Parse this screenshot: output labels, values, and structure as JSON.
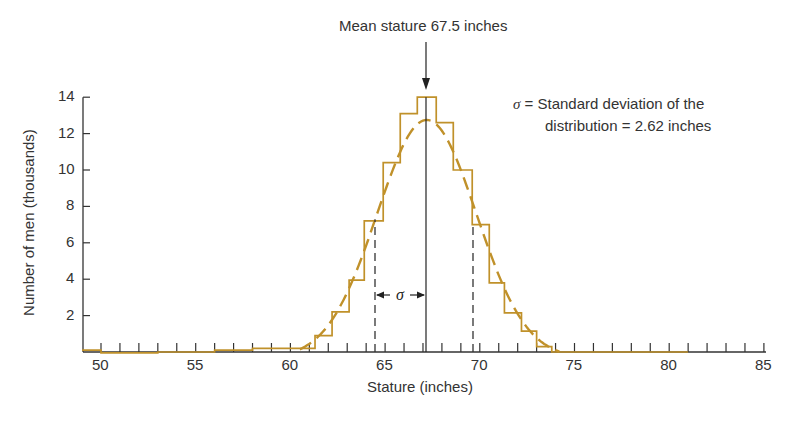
{
  "chart_data": {
    "type": "bar",
    "subtype": "histogram with fitted normal curve",
    "title": "Mean stature 67.5 inches",
    "xlabel": "Stature (inches)",
    "ylabel": "Number of men (thousands)",
    "xlim": [
      49,
      85
    ],
    "ylim": [
      0,
      14
    ],
    "x_ticks": [
      50,
      55,
      60,
      65,
      70,
      75,
      80,
      85
    ],
    "y_ticks": [
      2,
      4,
      6,
      8,
      10,
      12,
      14
    ],
    "grid": false,
    "annotation": {
      "symbol": "σ",
      "line1": "= Standard deviation of the",
      "line2": "distribution = 2.62 inches",
      "sigma_marker": "σ"
    },
    "mean": 67.5,
    "std_dev": 2.62,
    "histogram_bins": [
      {
        "x0": 49,
        "x1": 50,
        "value": 0.1
      },
      {
        "x0": 50,
        "x1": 53,
        "value": -0.05
      },
      {
        "x0": 53,
        "x1": 56,
        "value": 0.0
      },
      {
        "x0": 56,
        "x1": 58,
        "value": 0.1
      },
      {
        "x0": 58,
        "x1": 61.3,
        "value": 0.2
      },
      {
        "x0": 61.3,
        "x1": 62.2,
        "value": 0.9
      },
      {
        "x0": 62.2,
        "x1": 63.1,
        "value": 2.2
      },
      {
        "x0": 63.1,
        "x1": 63.9,
        "value": 3.95
      },
      {
        "x0": 63.9,
        "x1": 64.9,
        "value": 7.2
      },
      {
        "x0": 64.9,
        "x1": 65.8,
        "value": 10.4
      },
      {
        "x0": 65.8,
        "x1": 66.7,
        "value": 13.1
      },
      {
        "x0": 66.7,
        "x1": 67.7,
        "value": 14.0
      },
      {
        "x0": 67.7,
        "x1": 68.6,
        "value": 12.6
      },
      {
        "x0": 68.6,
        "x1": 69.6,
        "value": 10.0
      },
      {
        "x0": 69.6,
        "x1": 70.5,
        "value": 7.0
      },
      {
        "x0": 70.5,
        "x1": 71.3,
        "value": 3.8
      },
      {
        "x0": 71.3,
        "x1": 72.2,
        "value": 2.15
      },
      {
        "x0": 72.2,
        "x1": 73.0,
        "value": 1.15
      },
      {
        "x0": 73.0,
        "x1": 73.8,
        "value": 0.3
      },
      {
        "x0": 73.8,
        "x1": 81,
        "value": 0.0
      }
    ],
    "normal_curve_peak": 13.1,
    "colors": {
      "histogram": "#c0912a",
      "curve": "#c0912a",
      "axis": "#333333"
    }
  }
}
